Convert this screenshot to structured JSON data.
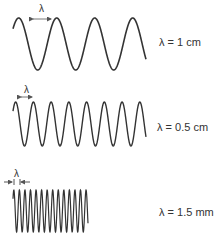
{
  "waves": [
    {
      "wavelength_label": "λ = 1 cm",
      "lambda_marker": "λ",
      "cycles": 3.5,
      "color": "#333333"
    },
    {
      "wavelength_label": "λ = 0.5 cm",
      "lambda_marker": "λ",
      "cycles": 7.5,
      "color": "#333333"
    },
    {
      "wavelength_label": "λ = 1.5 mm",
      "lambda_marker": "λ",
      "cycles": 13.5,
      "color": "#333333"
    }
  ]
}
